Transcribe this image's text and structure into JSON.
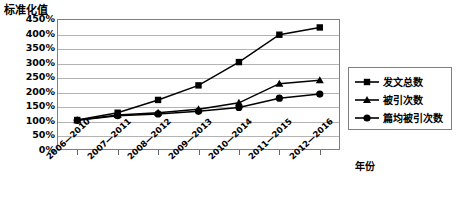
{
  "chart_data": {
    "type": "line",
    "title": "",
    "ylabel": "标准化值",
    "xlabel": "年份",
    "categories": [
      "2006—2010",
      "2007—2011",
      "2008—2012",
      "2009—2013",
      "2010—2014",
      "2011—2015",
      "2012—2016"
    ],
    "ylim": [
      0,
      450
    ],
    "yticks": [
      "0%",
      "50%",
      "100%",
      "150%",
      "200%",
      "250%",
      "300%",
      "350%",
      "400%",
      "450%"
    ],
    "ytick_values": [
      0,
      50,
      100,
      150,
      200,
      250,
      300,
      350,
      400,
      450
    ],
    "grid": true,
    "legend_position": "right",
    "series": [
      {
        "name": "发文总数",
        "marker": "square",
        "color": "#000000",
        "values": [
          103,
          128,
          172,
          222,
          302,
          396,
          421
        ]
      },
      {
        "name": "被引次数",
        "marker": "triangle",
        "color": "#000000",
        "values": [
          102,
          120,
          128,
          140,
          162,
          228,
          240
        ]
      },
      {
        "name": "篇均被引次数",
        "marker": "circle",
        "color": "#000000",
        "values": [
          102,
          118,
          124,
          133,
          146,
          178,
          192
        ]
      }
    ]
  },
  "legend": {
    "items": [
      {
        "label": "发文总数",
        "marker": "square"
      },
      {
        "label": "被引次数",
        "marker": "triangle"
      },
      {
        "label": "篇均被引次数",
        "marker": "circle"
      }
    ]
  }
}
